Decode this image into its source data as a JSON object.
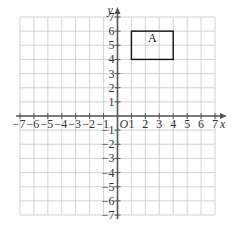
{
  "grid": {
    "x_min": -7,
    "x_max": 7,
    "y_min": -7,
    "y_max": 7,
    "grid_color": "#c8c8c8",
    "axis_color": "#555555"
  },
  "axes": {
    "x_label": "x",
    "y_label": "y",
    "origin_label": "O",
    "x_ticks": [
      "-7",
      "-6",
      "-5",
      "-4",
      "-3",
      "-2",
      "-1",
      "1",
      "2",
      "3",
      "4",
      "5",
      "6",
      "7"
    ],
    "y_ticks": [
      "7",
      "6",
      "5",
      "4",
      "3",
      "2",
      "1",
      "-1",
      "-2",
      "-3",
      "-4",
      "-5",
      "-6",
      "-7"
    ]
  },
  "shapes": [
    {
      "label": "A",
      "type": "rectangle",
      "x1": 1,
      "y1": 4,
      "x2": 4,
      "y2": 6,
      "stroke": "#111111"
    }
  ]
}
